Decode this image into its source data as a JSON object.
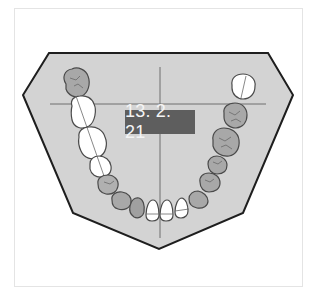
{
  "diagram": {
    "type": "dental-arch-chart",
    "date_label": "13. 2. 21",
    "colors": {
      "arch_fill": "#d3d3d3",
      "arch_stroke": "#1e1e1e",
      "crosshair": "#6e6e6e",
      "label_bg": "#5e5e5e",
      "label_text": "#f4f4f4",
      "tooth_healthy_fill": "#ffffff",
      "tooth_treated_fill": "#a8a8a8",
      "tooth_stroke": "#4a4a4a"
    },
    "teeth": {
      "right_side_posterior": [
        "treated",
        "healthy",
        "healthy",
        "healthy"
      ],
      "left_side_posterior": [
        "healthy",
        "treated",
        "treated",
        "treated",
        "treated"
      ],
      "anterior": [
        "treated",
        "treated",
        "treated",
        "healthy",
        "healthy",
        "healthy",
        "treated"
      ]
    }
  }
}
